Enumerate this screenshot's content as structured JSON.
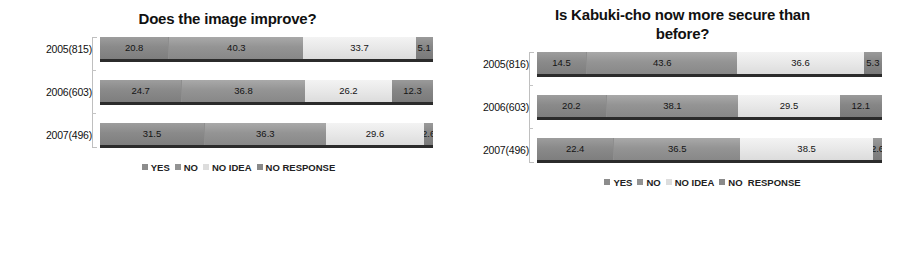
{
  "chart_data": [
    {
      "type": "bar",
      "orientation": "horizontal",
      "stacked": true,
      "percent": true,
      "title": "Does the image improve?",
      "xlabel": "",
      "ylabel": "",
      "xlim": [
        0,
        100
      ],
      "grid": false,
      "legend_position": "bottom",
      "categories": [
        "2005(815)",
        "2006(603)",
        "2007(496)"
      ],
      "series": [
        {
          "name": "YES",
          "values": [
            20.8,
            24.7,
            31.5
          ],
          "color": "#8c8c8c"
        },
        {
          "name": "NO",
          "values": [
            40.3,
            36.8,
            36.3
          ],
          "color": "#939393"
        },
        {
          "name": "NO IDEA",
          "values": [
            33.7,
            26.2,
            29.6
          ],
          "color": "#dddddd"
        },
        {
          "name": "NO RESPONSE",
          "values": [
            5.1,
            12.3,
            2.6
          ],
          "color": "#8a8a8a"
        }
      ],
      "legend": [
        "YES",
        "NO",
        "NO IDEA",
        "NO RESPONSE"
      ]
    },
    {
      "type": "bar",
      "orientation": "horizontal",
      "stacked": true,
      "percent": true,
      "title": "Is Kabuki-cho now more secure than before?",
      "title_line1": "Is Kabuki-cho now more secure than",
      "title_line2": "before?",
      "xlabel": "",
      "ylabel": "",
      "xlim": [
        0,
        100
      ],
      "grid": false,
      "legend_position": "bottom",
      "categories": [
        "2005(816)",
        "2006(603)",
        "2007(496)"
      ],
      "series": [
        {
          "name": "YES",
          "values": [
            14.5,
            20.2,
            22.4
          ],
          "color": "#8c8c8c"
        },
        {
          "name": "NO",
          "values": [
            43.6,
            38.1,
            36.5
          ],
          "color": "#939393"
        },
        {
          "name": "NO IDEA",
          "values": [
            36.6,
            29.5,
            38.5
          ],
          "color": "#dddddd"
        },
        {
          "name": "NO  RESPONSE",
          "values": [
            5.3,
            12.1,
            2.6
          ],
          "color": "#8a8a8a"
        }
      ],
      "legend": [
        "YES",
        "NO",
        "NO IDEA",
        "NO  RESPONSE"
      ]
    }
  ],
  "left_chart": {
    "title": "Does the image improve?",
    "rows": [
      {
        "label": "2005(815)",
        "segments": [
          {
            "key": "yes",
            "value": "20.8",
            "pct": 20.8
          },
          {
            "key": "no",
            "value": "40.3",
            "pct": 40.3
          },
          {
            "key": "noidea",
            "value": "33.7",
            "pct": 33.7
          },
          {
            "key": "noresp",
            "value": "5.1",
            "pct": 5.1
          }
        ]
      },
      {
        "label": "2006(603)",
        "segments": [
          {
            "key": "yes",
            "value": "24.7",
            "pct": 24.7
          },
          {
            "key": "no",
            "value": "36.8",
            "pct": 36.8
          },
          {
            "key": "noidea",
            "value": "26.2",
            "pct": 26.2
          },
          {
            "key": "noresp",
            "value": "12.3",
            "pct": 12.3
          }
        ]
      },
      {
        "label": "2007(496)",
        "segments": [
          {
            "key": "yes",
            "value": "31.5",
            "pct": 31.5
          },
          {
            "key": "no",
            "value": "36.3",
            "pct": 36.3
          },
          {
            "key": "noidea",
            "value": "29.6",
            "pct": 29.6
          },
          {
            "key": "noresp",
            "value": "2.6",
            "pct": 2.6
          }
        ]
      }
    ],
    "legend": [
      {
        "key": "yes",
        "label": "YES"
      },
      {
        "key": "no",
        "label": "NO"
      },
      {
        "key": "noidea",
        "label": "NO IDEA"
      },
      {
        "key": "noresp",
        "label": "NO RESPONSE"
      }
    ]
  },
  "right_chart": {
    "title_line1": "Is Kabuki-cho now more secure than",
    "title_line2": "before?",
    "rows": [
      {
        "label": "2005(816)",
        "segments": [
          {
            "key": "yes",
            "value": "14.5",
            "pct": 14.5
          },
          {
            "key": "no",
            "value": "43.6",
            "pct": 43.6
          },
          {
            "key": "noidea",
            "value": "36.6",
            "pct": 36.6
          },
          {
            "key": "noresp",
            "value": "5.3",
            "pct": 5.3
          }
        ]
      },
      {
        "label": "2006(603)",
        "segments": [
          {
            "key": "yes",
            "value": "20.2",
            "pct": 20.2
          },
          {
            "key": "no",
            "value": "38.1",
            "pct": 38.1
          },
          {
            "key": "noidea",
            "value": "29.5",
            "pct": 29.5
          },
          {
            "key": "noresp",
            "value": "12.1",
            "pct": 12.1
          }
        ]
      },
      {
        "label": "2007(496)",
        "segments": [
          {
            "key": "yes",
            "value": "22.4",
            "pct": 22.4
          },
          {
            "key": "no",
            "value": "36.5",
            "pct": 36.5
          },
          {
            "key": "noidea",
            "value": "38.5",
            "pct": 38.5
          },
          {
            "key": "noresp",
            "value": "2.6",
            "pct": 2.6
          }
        ]
      }
    ],
    "legend": [
      {
        "key": "yes",
        "label": "YES"
      },
      {
        "key": "no",
        "label": "NO"
      },
      {
        "key": "noidea",
        "label": "NO IDEA"
      },
      {
        "key": "noresp",
        "label": "NO  RESPONSE"
      }
    ]
  }
}
